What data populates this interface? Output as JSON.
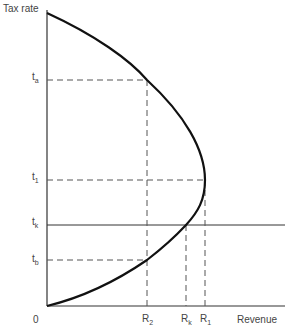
{
  "diagram": {
    "y_axis_label": "Tax rate",
    "x_axis_label": "Revenue",
    "origin_label": "0",
    "y_ticks": [
      {
        "base": "t",
        "sub": "a",
        "y": 80
      },
      {
        "base": "t",
        "sub": "1",
        "y": 180
      },
      {
        "base": "t",
        "sub": "k",
        "y": 225
      },
      {
        "base": "t",
        "sub": "b",
        "y": 260
      }
    ],
    "x_ticks": [
      {
        "base": "R",
        "sub": "2",
        "x": 147
      },
      {
        "base": "R",
        "sub": "k",
        "x": 186
      },
      {
        "base": "R",
        "sub": "1",
        "x": 205
      }
    ],
    "colors": {
      "curve": "#111111",
      "axes": "#333333",
      "guides": "#555555"
    }
  }
}
